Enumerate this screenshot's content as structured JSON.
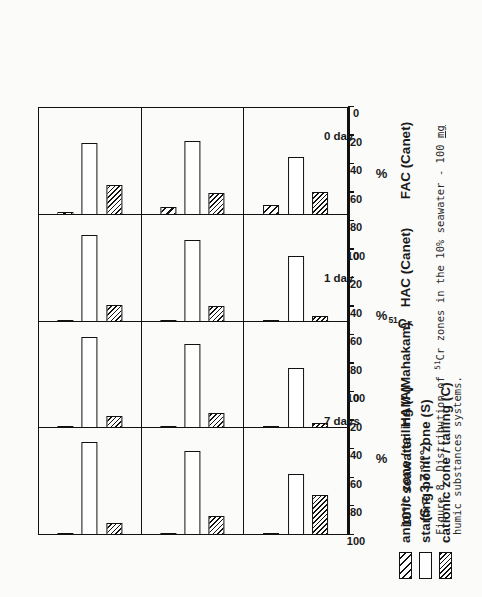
{
  "legend": {
    "items": [
      {
        "label": "anionic  zone / tailing  (A)",
        "pattern": "coarse-hatch",
        "key": "A"
      },
      {
        "label": "starting  point  zone  (S)",
        "pattern": "white",
        "key": "S"
      },
      {
        "label": "cationic  zone / tailing  (C)",
        "pattern": "fine-hatch",
        "key": "C"
      }
    ]
  },
  "axis": {
    "title": "%",
    "ticks": [
      "0",
      "20",
      "40",
      "60",
      "80",
      "100"
    ],
    "min": 0,
    "max": 100
  },
  "series_label": "51Cr",
  "series_label_sup": "51",
  "series_label_base": "Cr",
  "rows": [
    {
      "time": "7 days"
    },
    {
      "time": "1 day"
    },
    {
      "time": "0 day"
    }
  ],
  "columns": [
    {
      "label_line1": "10°/° seawater",
      "label_line2": "(S = 3.7 °/°° )"
    },
    {
      "label_line1": "HAM (Mahakam)",
      "label_line2": ""
    },
    {
      "label_line1": "HAC (Canet)",
      "label_line2": ""
    },
    {
      "label_line1": "FAC (Canet)",
      "label_line2": ""
    }
  ],
  "caption": {
    "prefix": "Figure 8.  Distribution of ",
    "sup": "51",
    "mid": "Cr zones in the 10% seawater - 100 ",
    "underlined": "mg",
    "suffix": " humic substances systems."
  },
  "chart_data": {
    "type": "bar",
    "orientation": "horizontal",
    "title": "Figure 8. Distribution of 51Cr zones in the 10% seawater - 100 mg humic substances systems.",
    "xlabel": "%",
    "ylabel": "",
    "xlim": [
      0,
      100
    ],
    "xticks": [
      0,
      20,
      40,
      60,
      80,
      100
    ],
    "grid": false,
    "legend_position": "top-left",
    "panel_rows": [
      "7 days",
      "1 day",
      "0 day"
    ],
    "panel_columns": [
      "10% seawater (S = 3.7 %o)",
      "HAM (Mahakam)",
      "HAC (Canet)",
      "FAC (Canet)"
    ],
    "series": [
      {
        "name": "anionic zone / tailing (A)",
        "pattern": "coarse-hatch"
      },
      {
        "name": "starting point zone (S)",
        "pattern": "white"
      },
      {
        "name": "cationic zone / tailing (C)",
        "pattern": "fine-hatch"
      }
    ],
    "panels": [
      {
        "row": "7 days",
        "cells": [
          {
            "column": "10% seawater (S = 3.7 %o)",
            "values": {
              "A": 1,
              "S": 88,
              "C": 11
            }
          },
          {
            "column": "HAM (Mahakam)",
            "values": {
              "A": 1,
              "S": 87,
              "C": 12
            }
          },
          {
            "column": "HAC (Canet)",
            "values": {
              "A": 2,
              "S": 82,
              "C": 16
            }
          },
          {
            "column": "FAC (Canet)",
            "values": {
              "A": 3,
              "S": 68,
              "C": 29
            }
          }
        ]
      },
      {
        "row": "1 day",
        "cells": [
          {
            "column": "10% seawater (S = 3.7 %o)",
            "values": {
              "A": 2,
              "S": 80,
              "C": 18
            }
          },
          {
            "column": "HAM (Mahakam)",
            "values": {
              "A": 1,
              "S": 80,
              "C": 15
            }
          },
          {
            "column": "HAC (Canet)",
            "values": {
              "A": 1,
              "S": 78,
              "C": 15
            }
          },
          {
            "column": "FAC (Canet)",
            "values": {
              "A": 8,
              "S": 70,
              "C": 21
            }
          }
        ]
      },
      {
        "row": "0 day",
        "cells": [
          {
            "column": "10% seawater (S = 3.7 %o)",
            "values": {
              "A": 1,
              "S": 58,
              "C": 38
            }
          },
          {
            "column": "HAM (Mahakam)",
            "values": {
              "A": 2,
              "S": 57,
              "C": 5
            }
          },
          {
            "column": "HAC (Canet)",
            "values": {
              "A": 2,
              "S": 63,
              "C": 6
            }
          },
          {
            "column": "FAC (Canet)",
            "values": {
              "A": 10,
              "S": 55,
              "C": 22
            }
          }
        ]
      }
    ]
  }
}
